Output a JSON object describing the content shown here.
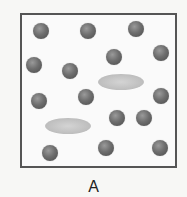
{
  "diagram": {
    "label": "A",
    "box": {
      "left": 20,
      "top": 13,
      "right": 176,
      "bottom": 167,
      "border_color": "#555555"
    },
    "particle_color": "#6e6e6e",
    "molecule_color": "#c0c0c0",
    "particles": [
      {
        "x": 41,
        "y": 31
      },
      {
        "x": 88,
        "y": 31
      },
      {
        "x": 136,
        "y": 29
      },
      {
        "x": 34,
        "y": 65
      },
      {
        "x": 70,
        "y": 71
      },
      {
        "x": 114,
        "y": 57
      },
      {
        "x": 161,
        "y": 53
      },
      {
        "x": 39,
        "y": 101
      },
      {
        "x": 86,
        "y": 97
      },
      {
        "x": 161,
        "y": 96
      },
      {
        "x": 117,
        "y": 118
      },
      {
        "x": 144,
        "y": 118
      },
      {
        "x": 50,
        "y": 153
      },
      {
        "x": 106,
        "y": 148
      },
      {
        "x": 160,
        "y": 148
      }
    ],
    "ellipses": [
      {
        "x": 121,
        "y": 82
      },
      {
        "x": 68,
        "y": 126
      }
    ]
  }
}
